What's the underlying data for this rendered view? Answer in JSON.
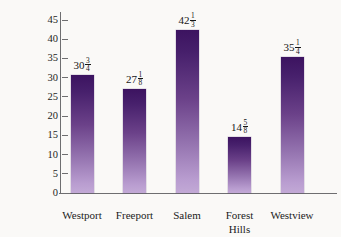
{
  "chart_data": {
    "type": "bar",
    "title": "",
    "xlabel": "",
    "ylabel": "Average yearly rainfall (in inches)",
    "categories": [
      "Westport",
      "Freeport",
      "Salem",
      "Forest Hills",
      "Westview"
    ],
    "category_lines": [
      [
        "Westport"
      ],
      [
        "Freeport"
      ],
      [
        "Salem"
      ],
      [
        "Forest",
        "Hills"
      ],
      [
        "Westview"
      ]
    ],
    "values": [
      30.75,
      27.125,
      42.3333,
      14.625,
      35.25
    ],
    "value_labels": [
      {
        "whole": "30",
        "num": "3",
        "den": "4"
      },
      {
        "whole": "27",
        "num": "1",
        "den": "8"
      },
      {
        "whole": "42",
        "num": "1",
        "den": "3"
      },
      {
        "whole": "14",
        "num": "5",
        "den": "8"
      },
      {
        "whole": "35",
        "num": "1",
        "den": "4"
      }
    ],
    "ylim": [
      0,
      45
    ],
    "yticks": [
      0,
      5,
      10,
      15,
      20,
      25,
      30,
      35,
      40,
      45
    ],
    "ytick_labels": [
      "0",
      "5",
      "10",
      "15",
      "20",
      "25",
      "30",
      "35",
      "40",
      "45"
    ],
    "grid": false,
    "legend": false,
    "bar_gradient_top": "#3c1360",
    "bar_gradient_bottom": "#c2a9d6",
    "axis_color": "#6e6e70",
    "background": "#faf9f7"
  }
}
